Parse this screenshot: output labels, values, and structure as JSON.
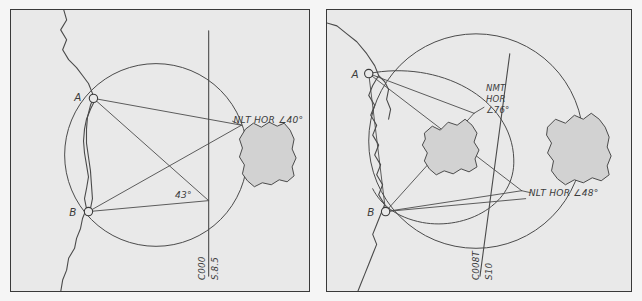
{
  "figure": {
    "panel_count": 2,
    "background_color": "#f5f5f5",
    "panel_fill": "#e9e9e9",
    "ink_color": "#4a4a4a",
    "island_fill": "#d2d2d2"
  },
  "panels": [
    {
      "id": "left",
      "name": "left-diagram",
      "points": [
        {
          "label": "A",
          "x": 83,
          "y": 89
        },
        {
          "label": "B",
          "x": 78,
          "y": 203
        }
      ],
      "annotations": [
        {
          "name": "nlt-hor-40",
          "text": "NLT HOR ∠40°",
          "x": 224,
          "y": 114
        },
        {
          "name": "angle-43",
          "text": "43°",
          "x": 167,
          "y": 187
        }
      ],
      "axis_labels": [
        {
          "name": "course-label",
          "text": "C000",
          "rotation": -90
        },
        {
          "name": "speed-label",
          "text": "S.8.5",
          "rotation": -90
        }
      ],
      "islands": 1
    },
    {
      "id": "right",
      "name": "right-diagram",
      "points": [
        {
          "label": "A",
          "x": 42,
          "y": 64
        },
        {
          "label": "B",
          "x": 59,
          "y": 203
        }
      ],
      "annotations": [
        {
          "name": "nmt-hor-76",
          "lines": [
            "NMT",
            "HOR",
            "∠76°"
          ],
          "x": 160,
          "y": 82
        },
        {
          "name": "nlt-hor-48",
          "text": "NLT HOR ∠48°",
          "x": 200,
          "y": 186
        }
      ],
      "axis_labels": [
        {
          "name": "course-label",
          "text": "C008T",
          "rotation": -90
        },
        {
          "name": "speed-label",
          "text": "S10",
          "rotation": -90
        }
      ],
      "islands": 2
    }
  ],
  "text": {
    "left": {
      "point_a": "A",
      "point_b": "B",
      "nlt_hor_40": "NLT HOR ∠40°",
      "angle_43": "43°",
      "course": "C000",
      "speed": "S.8.5"
    },
    "right": {
      "point_a": "A",
      "point_b": "B",
      "nmt_line1": "NMT",
      "nmt_line2": "HOR",
      "nmt_line3": "∠76°",
      "nlt_hor_48": "NLT HOR ∠48°",
      "course": "C008T",
      "speed": "S10"
    }
  }
}
